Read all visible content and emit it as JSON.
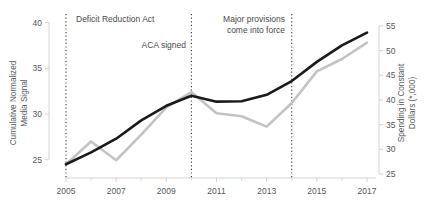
{
  "chart_data": {
    "type": "line",
    "title": "",
    "xlabel": "",
    "x": [
      2005,
      2006,
      2007,
      2008,
      2009,
      2010,
      2011,
      2012,
      2013,
      2014,
      2015,
      2016,
      2017
    ],
    "xlim": [
      2005,
      2017
    ],
    "x_tick_labels": [
      "2005",
      "2007",
      "2009",
      "2011",
      "2013",
      "2015",
      "2017"
    ],
    "x_ticks": [
      2005,
      2007,
      2009,
      2011,
      2013,
      2015,
      2017
    ],
    "x_minor_ticks": [
      2006,
      2008,
      2010,
      2012,
      2014,
      2016
    ],
    "grid": false,
    "legend": "none",
    "series": [
      {
        "name": "Cumulative Normalized Media Signal",
        "axis": "left",
        "color": "#1a1a1a",
        "width": 2.6,
        "ylabel": "Cumulative Normalized Media Signal",
        "ylim": [
          23,
          40.5
        ],
        "y_ticks": [
          25,
          30,
          35,
          40
        ],
        "y_tick_labels": [
          "25",
          "30",
          "35",
          "40"
        ],
        "values": [
          24.5,
          25.8,
          27.3,
          29.3,
          30.9,
          32.0,
          31.35,
          31.4,
          32.1,
          33.6,
          35.7,
          37.5,
          38.9
        ]
      },
      {
        "name": "Spending in Constant Dollars",
        "axis": "right",
        "color": "#c3c3c3",
        "width": 2.6,
        "ylabel": "Spending in Constant Dollars (*,000)",
        "ylim": [
          24.2,
          56.6
        ],
        "y_ticks": [
          25,
          30,
          35,
          40,
          45,
          50,
          55
        ],
        "y_tick_labels": [
          "25",
          "30",
          "35",
          "40",
          "45",
          "50",
          "55"
        ],
        "values": [
          27.0,
          31.6,
          27.8,
          33.0,
          38.5,
          41.6,
          37.3,
          36.7,
          34.6,
          39.4,
          45.8,
          48.3,
          51.6
        ]
      }
    ],
    "annotations": [
      {
        "name": "deficit-reduction-act",
        "label": "Deficit Reduction Act",
        "x": 2005,
        "line": "dotted",
        "text_align": "left",
        "text_x_px": 76,
        "text_y_px": 22
      },
      {
        "name": "aca-signed",
        "label": "ACA signed",
        "x": 2010,
        "line": "dotted",
        "text_align": "right",
        "text_x_px": 186,
        "text_y_px": 48
      },
      {
        "name": "major-provisions-come-into-force",
        "label_line1": "Major provisions",
        "label_line2": "come into force",
        "x": 2014,
        "line": "dotted",
        "text_align": "right",
        "text_x_px": 285,
        "text_y_px": 22
      }
    ],
    "colors": {
      "media_signal_line": "#1a1a1a",
      "spending_line": "#c3c3c3",
      "axis": "#d4d4d4",
      "tick_text": "#58595b",
      "annotation_text": "#4a4b4d",
      "dotted_guide": "#3a3a3a",
      "background": "#ffffff"
    }
  }
}
